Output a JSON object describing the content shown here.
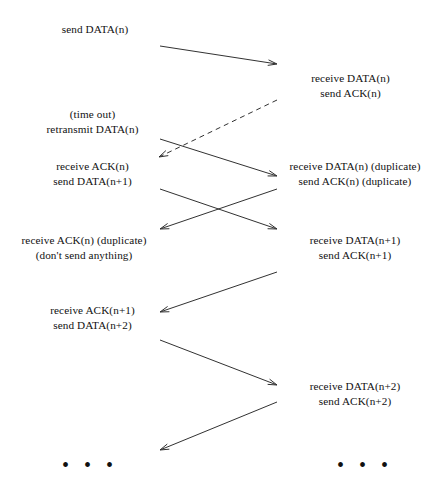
{
  "diagram": {
    "width": 427,
    "height": 489,
    "background_color": "#ffffff",
    "line_color": "#1a1a1a",
    "sender_x": 160,
    "receiver_x": 277,
    "labels": [
      {
        "id": "sender-send-data-n",
        "side": "sender",
        "x": 30,
        "y": 22,
        "width": 130,
        "align": "center",
        "lines": [
          "send DATA(n)"
        ]
      },
      {
        "id": "receiver-receive-data-n",
        "side": "receiver",
        "x": 283,
        "y": 71,
        "width": 135,
        "align": "center",
        "lines": [
          "receive DATA(n)",
          "send ACK(n)"
        ]
      },
      {
        "id": "sender-timeout-retransmit",
        "side": "sender",
        "x": 25,
        "y": 107,
        "width": 135,
        "align": "center",
        "lines": [
          "(time out)",
          "retransmit DATA(n)"
        ]
      },
      {
        "id": "sender-receive-ack-n",
        "side": "sender",
        "x": 25,
        "y": 159,
        "width": 135,
        "align": "center",
        "lines": [
          "receive ACK(n)",
          "send DATA(n+1)"
        ]
      },
      {
        "id": "receiver-receive-data-n-duplicate",
        "side": "receiver",
        "x": 283,
        "y": 159,
        "width": 144,
        "align": "center",
        "lines": [
          "receive DATA(n) (duplicate)",
          "send ACK(n) (duplicate)"
        ]
      },
      {
        "id": "sender-receive-ack-n-duplicate",
        "side": "sender",
        "x": 8,
        "y": 233,
        "width": 152,
        "align": "center",
        "lines": [
          "receive ACK(n) (duplicate)",
          "(don't send anything)"
        ]
      },
      {
        "id": "receiver-receive-data-n-plus-1",
        "side": "receiver",
        "x": 283,
        "y": 233,
        "width": 144,
        "align": "center",
        "lines": [
          "receive DATA(n+1)",
          "send ACK(n+1)"
        ]
      },
      {
        "id": "sender-receive-ack-n-plus-1",
        "side": "sender",
        "x": 25,
        "y": 303,
        "width": 135,
        "align": "center",
        "lines": [
          "receive ACK(n+1)",
          "send DATA(n+2)"
        ]
      },
      {
        "id": "receiver-receive-data-n-plus-2",
        "side": "receiver",
        "x": 283,
        "y": 379,
        "width": 144,
        "align": "center",
        "lines": [
          "receive DATA(n+2)",
          "send ACK(n+2)"
        ]
      }
    ],
    "messages": [
      {
        "id": "data-n",
        "direction": "sender-to-receiver",
        "style": "solid",
        "x1": 160,
        "y1": 46,
        "x2": 277,
        "y2": 64
      },
      {
        "id": "ack-n-lost",
        "direction": "receiver-to-sender",
        "style": "dashed",
        "x1": 277,
        "y1": 100,
        "x2": 159,
        "y2": 157
      },
      {
        "id": "retransmit-data-n",
        "direction": "sender-to-receiver",
        "style": "solid",
        "x1": 160,
        "y1": 139,
        "x2": 277,
        "y2": 176
      },
      {
        "id": "ack-n-duplicate",
        "direction": "receiver-to-sender",
        "style": "solid",
        "x1": 277,
        "y1": 189,
        "x2": 160,
        "y2": 229
      },
      {
        "id": "data-n-plus-1",
        "direction": "sender-to-receiver",
        "style": "solid",
        "x1": 160,
        "y1": 189,
        "x2": 277,
        "y2": 229
      },
      {
        "id": "ack-n-plus-1",
        "direction": "receiver-to-sender",
        "style": "solid",
        "x1": 277,
        "y1": 272,
        "x2": 160,
        "y2": 312
      },
      {
        "id": "data-n-plus-2",
        "direction": "sender-to-receiver",
        "style": "solid",
        "x1": 160,
        "y1": 340,
        "x2": 277,
        "y2": 385
      },
      {
        "id": "ack-n-plus-2",
        "direction": "receiver-to-sender",
        "style": "solid",
        "x1": 277,
        "y1": 402,
        "x2": 160,
        "y2": 450
      }
    ],
    "continuations": [
      {
        "id": "sender-continuation",
        "side": "sender",
        "x": 62,
        "y": 455,
        "text": "• • •"
      },
      {
        "id": "receiver-continuation",
        "side": "receiver",
        "x": 337,
        "y": 455,
        "text": "• • •"
      }
    ]
  }
}
